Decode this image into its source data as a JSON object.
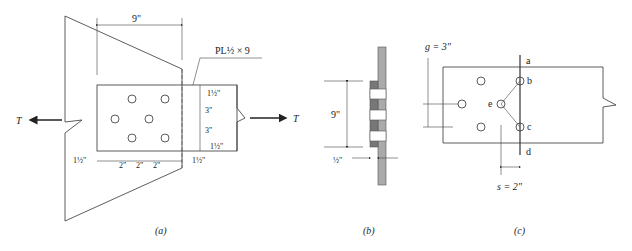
{
  "figure_a": {
    "caption": "(a)",
    "width_dim": "9\"",
    "plate_label": "PL½ × 9",
    "force_left": "T",
    "force_right": "T",
    "vert_dims": [
      "1½\"",
      "3\"",
      "3\"",
      "1½\""
    ],
    "horiz_dims": [
      "1½\"",
      "2\"",
      "2\"",
      "2\"",
      "1½\""
    ]
  },
  "figure_b": {
    "caption": "(b)",
    "height_dim": "9\"",
    "thickness_dim": "½\""
  },
  "figure_c": {
    "caption": "(c)",
    "gauge": "g = 3\"",
    "pitch": "s = 2\"",
    "points": [
      "a",
      "b",
      "e",
      "c",
      "d"
    ]
  }
}
